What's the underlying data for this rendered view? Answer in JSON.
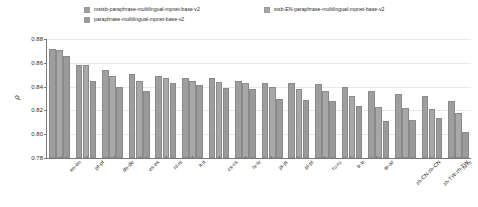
{
  "chart_data": {
    "type": "bar",
    "title": "",
    "xlabel": "",
    "ylabel": "ρ",
    "ylim": [
      0.78,
      0.88
    ],
    "yticks": [
      "0.78",
      "0.80",
      "0.82",
      "0.84",
      "0.86",
      "0.88"
    ],
    "grid": true,
    "legend_position": "top",
    "categories": [
      "en-en",
      "pt-pt",
      "de-de",
      "es-es",
      "nl-nl",
      "it-it",
      "cs-cs",
      "lv-lv",
      "ja-ja",
      "pl-pl",
      "ru-ru",
      "tr-tr",
      "ar-ar",
      "zh-CN-zh-CN",
      "zh-TW-zh-TW",
      "hi-hi"
    ],
    "series": [
      {
        "name": "mstsb-paraphrase-multilingual-mpnet-base-v2",
        "color": "#9e9e9e",
        "values": [
          0.872,
          0.858,
          0.854,
          0.851,
          0.849,
          0.847,
          0.847,
          0.845,
          0.843,
          0.843,
          0.842,
          0.84,
          0.836,
          0.834,
          0.832,
          0.828
        ]
      },
      {
        "name": "stsb-EN-paraphrase-multilingual-mpnet-base-v2",
        "color": "#a8a8a8",
        "values": [
          0.871,
          0.858,
          0.849,
          0.845,
          0.847,
          0.845,
          0.844,
          0.843,
          0.84,
          0.838,
          0.836,
          0.832,
          0.823,
          0.822,
          0.821,
          0.818
        ]
      },
      {
        "name": "paraphrase-multilingual-mpnet-base-v2",
        "color": "#9a9a9a",
        "values": [
          0.866,
          0.845,
          0.84,
          0.836,
          0.843,
          0.841,
          0.839,
          0.838,
          0.83,
          0.829,
          0.828,
          0.824,
          0.811,
          0.812,
          0.814,
          0.802
        ]
      }
    ]
  },
  "legend": {
    "items": [
      {
        "label": "mstsb-paraphrase-multilingual-mpnet-base-v2"
      },
      {
        "label": "stsb-EN-paraphrase-multilingual-mpnet-base-v2"
      },
      {
        "label": "paraphrase-multilingual-mpnet-base-v2"
      }
    ]
  }
}
